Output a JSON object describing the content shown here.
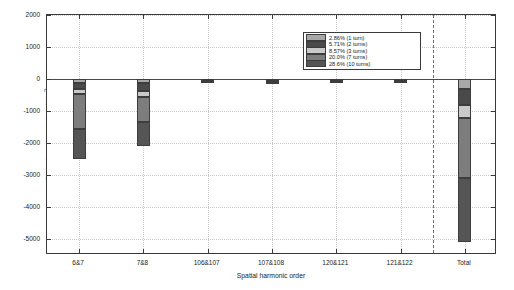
{
  "chart_data": {
    "type": "bar",
    "stacked": true,
    "title": "",
    "xlabel": "Spatial harmonic order",
    "ylabel": "Radial force density, f_r,stat [N/m²]",
    "ylabel_main": "Radial force density, f",
    "ylabel_sub": "r, stat",
    "ylabel_unit": " [N/m",
    "ylabel_sup": "2",
    "ylabel_end": "]",
    "categories": [
      "6&7",
      "7&8",
      "106&107",
      "107&108",
      "120&121",
      "121&122",
      "Total"
    ],
    "ylim": [
      -5500,
      2000
    ],
    "yticks": [
      2000,
      1000,
      0,
      -1000,
      -2000,
      -3000,
      -4000,
      -5000
    ],
    "ytick_labels": [
      "2000",
      "1000",
      "0",
      "-1000",
      "-2000",
      "-3000",
      "-4000",
      "-5000"
    ],
    "grid": true,
    "legend_position": "top-right",
    "separator_after_category": "121&122",
    "series": [
      {
        "name": "2.86% (1 turn)",
        "color": "#a8a8a8",
        "values": [
          -120,
          -140,
          -10,
          -12,
          -10,
          -11,
          -300
        ]
      },
      {
        "name": "5.71% (2 turns)",
        "color": "#4a4a4a",
        "values": [
          -200,
          -250,
          -20,
          -22,
          -20,
          -21,
          -520
        ]
      },
      {
        "name": "8.57% (3 turns)",
        "color": "#c9c9c9",
        "values": [
          -160,
          -180,
          -15,
          -16,
          -14,
          -15,
          -400
        ]
      },
      {
        "name": "20.0% (7 turns)",
        "color": "#7d7d7d",
        "values": [
          -1070,
          -760,
          -30,
          -32,
          -28,
          -30,
          -1880
        ]
      },
      {
        "name": "28.6% (10 turns)",
        "color": "#555555",
        "values": [
          -940,
          -770,
          -35,
          -36,
          -32,
          -34,
          -2000
        ]
      }
    ],
    "totals": [
      -2490,
      -2100,
      -110,
      -118,
      -104,
      -111,
      -5100
    ]
  },
  "legend": {
    "entries": [
      {
        "label": "2.86% (1 turn)"
      },
      {
        "label": "5.71% (2 turns)"
      },
      {
        "label": "8.57% (3 turns)"
      },
      {
        "label": "20.0% (7 turns)"
      },
      {
        "label": "28.6% (10 turns)"
      }
    ]
  }
}
